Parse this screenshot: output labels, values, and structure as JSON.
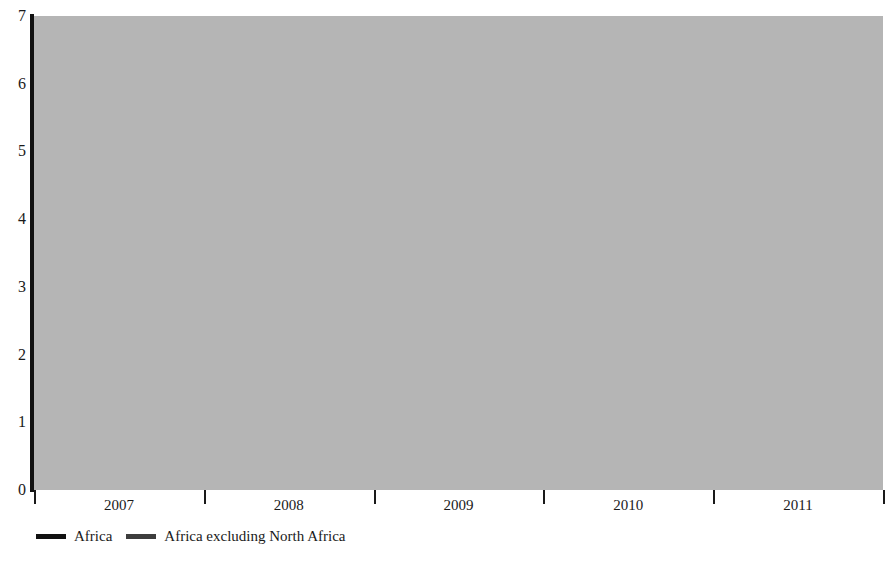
{
  "chart_data": {
    "type": "line",
    "title": "",
    "xlabel": "",
    "ylabel": "",
    "categories": [
      "2007",
      "2008",
      "2009",
      "2010",
      "2011"
    ],
    "yticks": [
      0,
      1,
      2,
      3,
      4,
      5,
      6,
      7
    ],
    "ylim": [
      0,
      7
    ],
    "grid": "horizontal",
    "legend_position": "bottom-left",
    "series": [
      {
        "name": "Africa",
        "color": "#111111",
        "values": [
          5.9,
          5.15,
          2.1,
          4.5,
          2.75
        ]
      },
      {
        "name": "Africa excluding North Africa",
        "color": "#3d3d3d",
        "values": [
          6.3,
          5.2,
          1.55,
          4.7,
          4.4
        ]
      }
    ]
  },
  "colors": {
    "plot_background": "#b5b5b5",
    "gridline": "#ffffff",
    "axis": "#111111",
    "text": "#1a1a1a",
    "page_background": "#ffffff"
  },
  "legend": {
    "items": [
      {
        "label": "Africa",
        "color": "#111111"
      },
      {
        "label": "Africa excluding North Africa",
        "color": "#3d3d3d"
      }
    ]
  },
  "axis_labels": {
    "y": [
      "7",
      "6",
      "5",
      "4",
      "3",
      "2",
      "1",
      "0"
    ],
    "x": [
      "2007",
      "2008",
      "2009",
      "2010",
      "2011"
    ]
  }
}
